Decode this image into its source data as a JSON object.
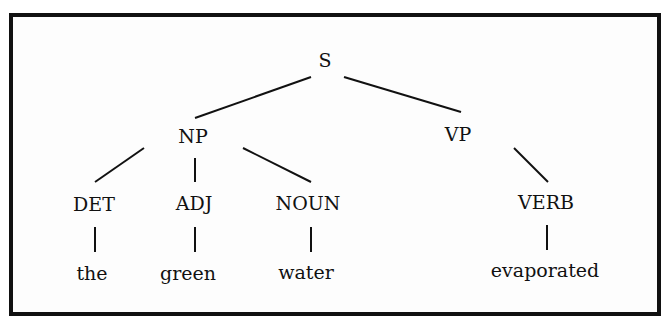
{
  "diagram": {
    "type": "parse-tree",
    "nodes": {
      "s": {
        "label": "S"
      },
      "np": {
        "label": "NP"
      },
      "vp": {
        "label": "VP"
      },
      "det": {
        "label": "DET"
      },
      "adj": {
        "label": "ADJ"
      },
      "noun": {
        "label": "NOUN"
      },
      "verb": {
        "label": "VERB"
      },
      "the": {
        "label": "the"
      },
      "green": {
        "label": "green"
      },
      "water": {
        "label": "water"
      },
      "evaporated": {
        "label": "evaporated"
      }
    },
    "edges": [
      [
        "S",
        "NP"
      ],
      [
        "S",
        "VP"
      ],
      [
        "NP",
        "DET"
      ],
      [
        "NP",
        "ADJ"
      ],
      [
        "NP",
        "NOUN"
      ],
      [
        "VP",
        "VERB"
      ],
      [
        "DET",
        "the"
      ],
      [
        "ADJ",
        "green"
      ],
      [
        "NOUN",
        "water"
      ],
      [
        "VERB",
        "evaporated"
      ]
    ],
    "line_color": "#111111"
  }
}
